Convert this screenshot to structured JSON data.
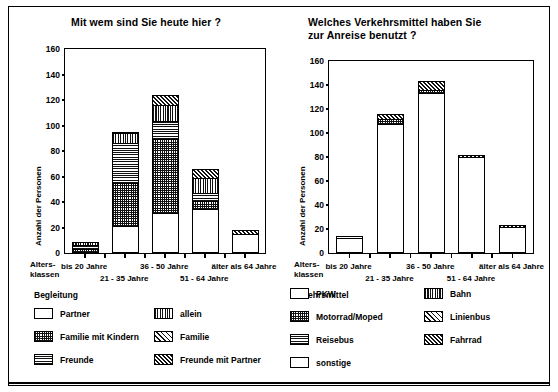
{
  "figure": {
    "axis_label_y": "Anzahl der Personen",
    "axis_group_label_line1": "Alters-",
    "axis_group_label_line2": "klassen"
  },
  "chart_data": [
    {
      "id": "left",
      "type": "bar",
      "stacked": true,
      "title": "Mit wem sind Sie heute hier ?",
      "xlabel": "Altersklassen",
      "ylabel": "Anzahl der Personen",
      "ylim": [
        0,
        160
      ],
      "yticks": [
        0,
        20,
        40,
        60,
        80,
        100,
        120,
        140,
        160
      ],
      "grid": false,
      "legend_position": "below",
      "legend_title": "Begleitung",
      "categories": [
        "bis 20 Jahre",
        "21 - 35 Jahre",
        "36 - 50 Jahre",
        "51 - 64 Jahre",
        "älter als 64 Jahre"
      ],
      "series": [
        {
          "name": "Partner",
          "pattern": "white",
          "values": [
            0,
            20,
            30,
            34,
            15
          ]
        },
        {
          "name": "Familie mit Kindern",
          "pattern": "check",
          "values": [
            2,
            34,
            59,
            6,
            0
          ]
        },
        {
          "name": "Freunde",
          "pattern": "horz",
          "values": [
            4,
            32,
            14,
            7,
            0
          ]
        },
        {
          "name": "allein",
          "pattern": "vert",
          "values": [
            3,
            8,
            13,
            12,
            0
          ]
        },
        {
          "name": "Familie",
          "pattern": "diag",
          "values": [
            0,
            0,
            0,
            0,
            0
          ]
        },
        {
          "name": "Freunde mit Partner",
          "pattern": "ddiag",
          "values": [
            0,
            1,
            8,
            7,
            3
          ]
        }
      ],
      "totals": [
        9,
        95,
        124,
        66,
        18
      ]
    },
    {
      "id": "right",
      "type": "bar",
      "stacked": true,
      "title_line1": "Welches Verkehrsmittel haben Sie",
      "title_line2": "zur Anreise benutzt ?",
      "xlabel": "Altersklassen",
      "ylabel": "Anzahl der Personen",
      "ylim": [
        0,
        160
      ],
      "yticks": [
        0,
        20,
        40,
        60,
        80,
        100,
        120,
        140,
        160
      ],
      "grid": false,
      "legend_position": "below",
      "legend_title": "Verkehrsmittel",
      "categories": [
        "bis 20 Jahre",
        "21 - 35 Jahre",
        "36 - 50 Jahre",
        "51 - 64 Jahre",
        "älter als 64 Jahre"
      ],
      "series": [
        {
          "name": "PKW",
          "pattern": "white",
          "values": [
            12,
            107,
            133,
            80,
            22
          ]
        },
        {
          "name": "Motorrad/Moped",
          "pattern": "check",
          "values": [
            0,
            5,
            3,
            0,
            0
          ]
        },
        {
          "name": "Reisebus",
          "pattern": "horz",
          "values": [
            0,
            0,
            0,
            0,
            0
          ]
        },
        {
          "name": "Bahn",
          "pattern": "vert",
          "values": [
            0,
            0,
            0,
            0,
            0
          ]
        },
        {
          "name": "Linienbus",
          "pattern": "diag",
          "values": [
            0,
            0,
            0,
            0,
            0
          ]
        },
        {
          "name": "Fahrrad",
          "pattern": "ddiag",
          "values": [
            0,
            4,
            7,
            2,
            1
          ]
        },
        {
          "name": "sonstige",
          "pattern": "white2",
          "values": [
            2,
            0,
            0,
            0,
            0
          ]
        }
      ],
      "totals": [
        14,
        116,
        143,
        82,
        23
      ]
    }
  ],
  "charts": {
    "left": {
      "title": "Mit wem sind Sie heute hier ?",
      "ylabel": "Anzahl der Personen",
      "yticks": [
        "160",
        "140",
        "120",
        "100",
        "80",
        "60",
        "40",
        "20",
        "0"
      ],
      "xlabels_top": [
        "bis 20 Jahre",
        "36 - 50 Jahre",
        "älter als 64 Jahre"
      ],
      "xlabels_bottom": [
        "21 - 35 Jahre",
        "51 - 64 Jahre"
      ]
    },
    "right": {
      "title_line1": "Welches Verkehrsmittel haben Sie",
      "title_line2": "zur Anreise benutzt ?",
      "ylabel": "Anzahl der Personen",
      "yticks": [
        "160",
        "140",
        "120",
        "100",
        "80",
        "60",
        "40",
        "20",
        "0"
      ],
      "xlabels_top": [
        "bis 20 Jahre",
        "36 - 50 Jahre",
        "älter als 64 Jahre"
      ],
      "xlabels_bottom": [
        "21 - 35 Jahre",
        "51 - 64 Jahre"
      ]
    }
  },
  "legends": {
    "left": {
      "title": "Begleitung",
      "items": [
        {
          "label": "Partner",
          "pattern": "white"
        },
        {
          "label": "allein",
          "pattern": "vert"
        },
        {
          "label": "Familie mit Kindern",
          "pattern": "check"
        },
        {
          "label": "Familie",
          "pattern": "diag"
        },
        {
          "label": "Freunde",
          "pattern": "horz"
        },
        {
          "label": "Freunde mit Partner",
          "pattern": "ddiag"
        }
      ]
    },
    "right": {
      "title": "Verkehrsmittel",
      "items": [
        {
          "label": "PKW",
          "pattern": "white"
        },
        {
          "label": "Bahn",
          "pattern": "vert"
        },
        {
          "label": "Motorrad/Moped",
          "pattern": "check"
        },
        {
          "label": "Linienbus",
          "pattern": "diag"
        },
        {
          "label": "Reisebus",
          "pattern": "horz"
        },
        {
          "label": "Fahrrad",
          "pattern": "ddiag"
        },
        {
          "label": "sonstige",
          "pattern": "white"
        }
      ]
    }
  },
  "colors": {
    "ink": "#000000",
    "paper": "#ffffff"
  }
}
